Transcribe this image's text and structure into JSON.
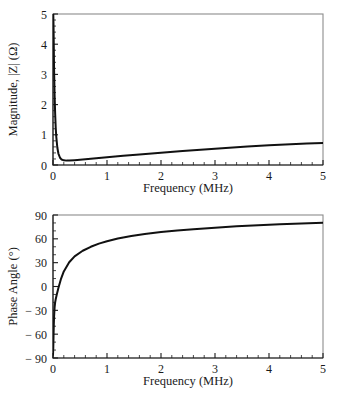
{
  "figure": {
    "background_color": "#ffffff",
    "curve_color": "#111111",
    "frame_color": "#8c8c8c",
    "text_color": "#1a1a1a",
    "caption_remnant": ""
  },
  "panels": {
    "magnitude": {
      "name": "Magnitude panel"
    },
    "phase": {
      "name": "Phase angle panel"
    }
  },
  "chart_data": [
    {
      "type": "line",
      "id": "magnitude",
      "title": "",
      "xlabel": "Frequency (MHz)",
      "ylabel": "Magnitude, |Z| (Ω)",
      "xlim": [
        0,
        5
      ],
      "ylim": [
        0,
        5
      ],
      "xticks": [
        0,
        1,
        2,
        3,
        4,
        5
      ],
      "yticks": [
        0,
        1,
        2,
        3,
        4,
        5
      ],
      "xtick_labels": [
        "0",
        "1",
        "2",
        "3",
        "4",
        "5"
      ],
      "ytick_labels": [
        "0",
        "1",
        "2",
        "3",
        "4",
        "5"
      ],
      "x_minor_per_major": 5,
      "y_minor_per_major": 5,
      "grid": false,
      "legend": false,
      "legend_position": "none",
      "series": [
        {
          "name": "|Z|",
          "x": [
            0.0,
            0.005,
            0.01,
            0.02,
            0.03,
            0.04,
            0.05,
            0.06,
            0.08,
            0.1,
            0.13,
            0.16,
            0.2,
            0.25,
            0.3,
            0.4,
            0.5,
            0.7,
            1.0,
            1.3,
            1.6,
            2.0,
            2.4,
            2.8,
            3.2,
            3.6,
            4.0,
            4.4,
            4.7,
            5.0
          ],
          "y": [
            5.0,
            5.0,
            4.6,
            3.15,
            2.3,
            1.7,
            1.25,
            0.95,
            0.58,
            0.38,
            0.24,
            0.18,
            0.155,
            0.145,
            0.148,
            0.16,
            0.175,
            0.208,
            0.258,
            0.305,
            0.35,
            0.405,
            0.46,
            0.513,
            0.563,
            0.61,
            0.65,
            0.688,
            0.708,
            0.725
          ]
        }
      ]
    },
    {
      "type": "line",
      "id": "phase",
      "title": "",
      "xlabel": "Frequency (MHz)",
      "ylabel": "Phase Angle (°)",
      "xlim": [
        0,
        5
      ],
      "ylim": [
        -90,
        90
      ],
      "xticks": [
        0,
        1,
        2,
        3,
        4,
        5
      ],
      "yticks": [
        -90,
        -60,
        -30,
        0,
        30,
        60,
        90
      ],
      "xtick_labels": [
        "0",
        "1",
        "2",
        "3",
        "4",
        "5"
      ],
      "ytick_labels": [
        "− 90",
        "− 60",
        "− 30",
        "0",
        "30",
        "60",
        "90"
      ],
      "x_minor_per_major": 5,
      "y_minor_per_major": 3,
      "grid": false,
      "legend": false,
      "legend_position": "none",
      "series": [
        {
          "name": "Phase",
          "x": [
            0.0,
            0.005,
            0.01,
            0.015,
            0.02,
            0.03,
            0.04,
            0.05,
            0.07,
            0.1,
            0.15,
            0.2,
            0.3,
            0.4,
            0.55,
            0.7,
            0.85,
            1.0,
            1.2,
            1.45,
            1.7,
            2.0,
            2.3,
            2.6,
            3.0,
            3.4,
            3.8,
            4.2,
            4.6,
            5.0
          ],
          "y": [
            -86.0,
            -78.0,
            -62.0,
            -48.0,
            -38.0,
            -26.0,
            -20.0,
            -16.0,
            -10.0,
            -2.0,
            10.0,
            19.0,
            30.5,
            38.0,
            45.0,
            50.0,
            54.0,
            57.0,
            60.5,
            63.5,
            66.0,
            68.5,
            70.5,
            72.0,
            74.0,
            75.8,
            77.2,
            78.3,
            79.3,
            80.2
          ]
        }
      ]
    }
  ]
}
